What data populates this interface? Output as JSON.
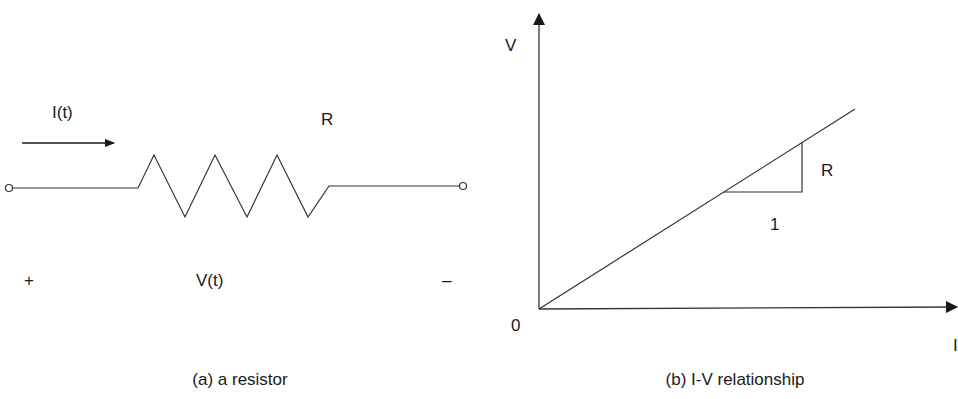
{
  "panel_a": {
    "current_label": "I(t)",
    "resistor_label": "R",
    "plus_sign": "+",
    "voltage_label": "V(t)",
    "minus_sign": "–",
    "caption": "(a) a resistor"
  },
  "panel_b": {
    "y_axis_label": "V",
    "x_axis_label": "I",
    "origin_label": "0",
    "slope_rise_label": "R",
    "slope_run_label": "1",
    "caption": "(b) I-V relationship"
  },
  "colors": {
    "line": "#333333",
    "text": "#1a1a1a",
    "background": "#ffffff"
  }
}
